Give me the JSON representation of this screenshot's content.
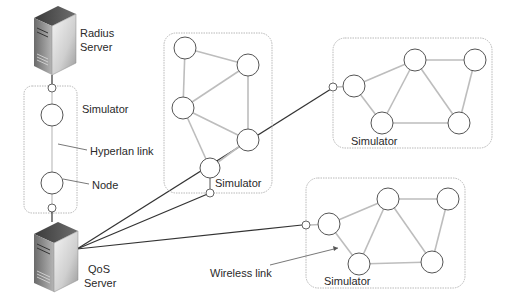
{
  "diagram": {
    "type": "network-architecture",
    "servers": [
      {
        "id": "radius",
        "label_line1": "Radius",
        "label_line2": "Server"
      },
      {
        "id": "qos",
        "label_line1": "QoS",
        "label_line2": "Server"
      }
    ],
    "labels": {
      "left_simulator": "Simulator",
      "hyperlan_link": "Hyperlan link",
      "node": "Node",
      "middle_simulator": "Simulator",
      "top_right_simulator": "Simulator",
      "bottom_right_simulator": "Simulator",
      "wireless_link": "Wireless link"
    },
    "simulators": [
      {
        "id": "left",
        "nodes": 2,
        "link_type": "Hyperlan link"
      },
      {
        "id": "middle",
        "nodes": 5
      },
      {
        "id": "top-right",
        "nodes": 5
      },
      {
        "id": "bottom-right",
        "nodes": 5,
        "link_type": "Wireless link"
      }
    ],
    "connections": [
      "Radius Server - left Simulator",
      "left Simulator - QoS Server",
      "QoS Server - middle Simulator",
      "QoS Server - top-right Simulator",
      "QoS Server - bottom-right Simulator"
    ]
  }
}
